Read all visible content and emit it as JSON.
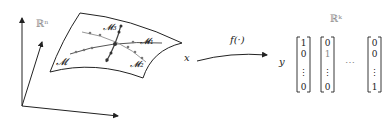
{
  "diagram": {
    "input_space": {
      "label": "ℝⁿ"
    },
    "manifold": {
      "labels": {
        "main": "𝓜",
        "m1": "𝓜₁",
        "m2": "𝓜₂",
        "m3": "𝓜₃"
      }
    },
    "input_var": "x",
    "mapping": {
      "label": "f(·)"
    },
    "output_var": "y",
    "output_space": {
      "label": "ℝᵏ"
    },
    "vectors": [
      {
        "entries": [
          "1",
          "0",
          "⋮",
          "0"
        ]
      },
      {
        "entries": [
          "0",
          "1",
          "⋮",
          "0"
        ]
      },
      {
        "entries": [
          "0",
          "0",
          "⋮",
          "1"
        ]
      }
    ],
    "ellipsis": "⋯"
  },
  "colors": {
    "ink": "#222222",
    "gray_curve": "#9a9a9a",
    "dark_curve": "#555555"
  }
}
